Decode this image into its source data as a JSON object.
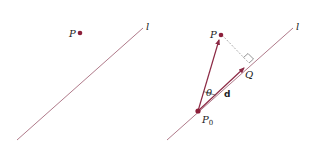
{
  "colors": {
    "line": "#b07a8a",
    "vector": "#8c2a45",
    "point": "#8c1f3a",
    "dashed": "#999999",
    "text": "#222222"
  },
  "left_panel": {
    "point_label": "P",
    "line_label": "l"
  },
  "right_panel": {
    "point_label": "P",
    "line_label": "l",
    "base_point_label": "P",
    "base_point_subscript": "0",
    "foot_label": "Q",
    "angle_label": "θ",
    "direction_vector_label": "d"
  }
}
